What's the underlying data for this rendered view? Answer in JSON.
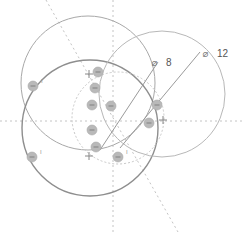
{
  "diagram": {
    "type": "circle-overlap-geometry",
    "colors": {
      "background": "#ffffff",
      "circle_top": "#a8a8a8",
      "circle_bottom": "#8e8e8e",
      "circle_right": "#b8b8b8",
      "circle_inner_dotted": "#c8c8c8",
      "guide_dotted": "#c4c4c4",
      "leader_line": "#9a9a9a",
      "marker_fill": "#b9b9b9",
      "marker_dark": "#8a8a8a",
      "text": "#555555"
    },
    "circles": [
      {
        "id": "top",
        "cx": 88,
        "cy": 83,
        "r": 67
      },
      {
        "id": "bottom",
        "cx": 90,
        "cy": 128,
        "r": 68
      },
      {
        "id": "right",
        "cx": 162,
        "cy": 94,
        "r": 63
      },
      {
        "id": "inner",
        "cx": 118,
        "cy": 118,
        "r": 46
      }
    ],
    "dimensions": [
      {
        "symbol": "⌀",
        "value": "8",
        "x1": 100,
        "y1": 150,
        "x2": 158,
        "y2": 62,
        "label_x": 166,
        "label_y": 64
      },
      {
        "symbol": "⌀",
        "value": "12",
        "x1": 120,
        "y1": 148,
        "x2": 200,
        "y2": 52,
        "label_x": 217,
        "label_y": 55
      }
    ],
    "centers": [
      {
        "id": "center-top",
        "x": 89,
        "y": 74
      },
      {
        "id": "center-bottom",
        "x": 89,
        "y": 156
      },
      {
        "id": "center-right",
        "x": 163,
        "y": 120
      }
    ],
    "markers": [
      {
        "x": 33,
        "y": 86,
        "tick": "I"
      },
      {
        "x": 32,
        "y": 157,
        "tick": "I"
      },
      {
        "x": 98,
        "y": 72
      },
      {
        "x": 95,
        "y": 88
      },
      {
        "x": 92,
        "y": 105
      },
      {
        "x": 111,
        "y": 106
      },
      {
        "x": 92,
        "y": 130
      },
      {
        "x": 96,
        "y": 147
      },
      {
        "x": 118,
        "y": 157,
        "tick": "I"
      },
      {
        "x": 157,
        "y": 105
      },
      {
        "x": 149,
        "y": 123
      }
    ]
  }
}
